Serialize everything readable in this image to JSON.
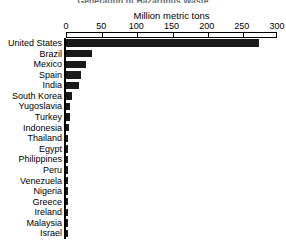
{
  "chart_data": {
    "type": "bar",
    "orientation": "horizontal",
    "title": "Generation of Hazardous Waste",
    "xlabel": "Million metric tons",
    "ylabel": "",
    "xlim": [
      0,
      300
    ],
    "xticks": [
      0,
      50,
      100,
      150,
      200,
      250,
      300
    ],
    "xticklabels": [
      "0",
      "50",
      "100",
      "150",
      "200",
      "250",
      "300"
    ],
    "grid": false,
    "legend": false,
    "units": "Million metric tons",
    "bar_color": "#1a1a1a",
    "categories": [
      "United States",
      "Brazil",
      "Mexico",
      "Spain",
      "India",
      "South Korea",
      "Yugoslavia",
      "Turkey",
      "Indonesia",
      "Thailand",
      "Egypt",
      "Philippines",
      "Peru",
      "Venezuela",
      "Nigeria",
      "Greece",
      "Ireland",
      "Malaysia",
      "Israel"
    ],
    "values": [
      275,
      37,
      28,
      21,
      18,
      9,
      6,
      5,
      4,
      3.5,
      3,
      2.5,
      2.2,
      2,
      1.8,
      1.6,
      1.4,
      1.2,
      1
    ]
  }
}
